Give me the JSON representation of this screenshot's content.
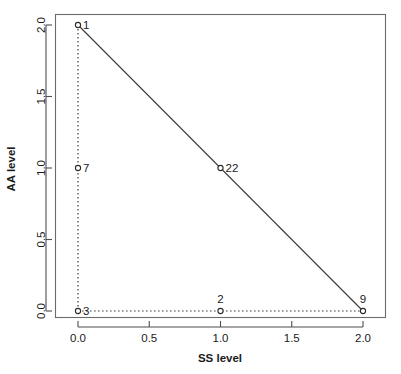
{
  "chart_data": {
    "type": "scatter",
    "title": "",
    "xlabel": "SS level",
    "ylabel": "AA level",
    "xlim": [
      -0.08,
      2.12
    ],
    "ylim": [
      -0.08,
      2.08
    ],
    "xticks": [
      "0.0",
      "0.5",
      "1.0",
      "1.5",
      "2.0"
    ],
    "xtick_values": [
      0.0,
      0.5,
      1.0,
      1.5,
      2.0
    ],
    "yticks": [
      "0.0",
      "0.5",
      "1.0",
      "1.5",
      "2.0"
    ],
    "ytick_values": [
      0.0,
      0.5,
      1.0,
      1.5,
      2.0
    ],
    "grid": false,
    "legend": null,
    "points": [
      {
        "label": "1",
        "x": 0.0,
        "y": 2.0,
        "label_pos": "right"
      },
      {
        "label": "7",
        "x": 0.0,
        "y": 1.0,
        "label_pos": "right"
      },
      {
        "label": "22",
        "x": 1.0,
        "y": 1.0,
        "label_pos": "right"
      },
      {
        "label": "3",
        "x": 0.0,
        "y": 0.0,
        "label_pos": "right"
      },
      {
        "label": "2",
        "x": 1.0,
        "y": 0.0,
        "label_pos": "above"
      },
      {
        "label": "9",
        "x": 2.0,
        "y": 0.0,
        "label_pos": "above"
      }
    ],
    "lines": [
      {
        "name": "diagonal-edge",
        "style": "solid",
        "points": [
          [
            0.0,
            2.0
          ],
          [
            1.0,
            1.0
          ],
          [
            2.0,
            0.0
          ]
        ]
      },
      {
        "name": "left-vertical-edge",
        "style": "dotted",
        "points": [
          [
            0.0,
            2.0
          ],
          [
            0.0,
            1.0
          ],
          [
            0.0,
            0.0
          ]
        ]
      },
      {
        "name": "bottom-horizontal-edge",
        "style": "dotted",
        "points": [
          [
            0.0,
            0.0
          ],
          [
            1.0,
            0.0
          ],
          [
            2.0,
            0.0
          ]
        ]
      }
    ]
  }
}
